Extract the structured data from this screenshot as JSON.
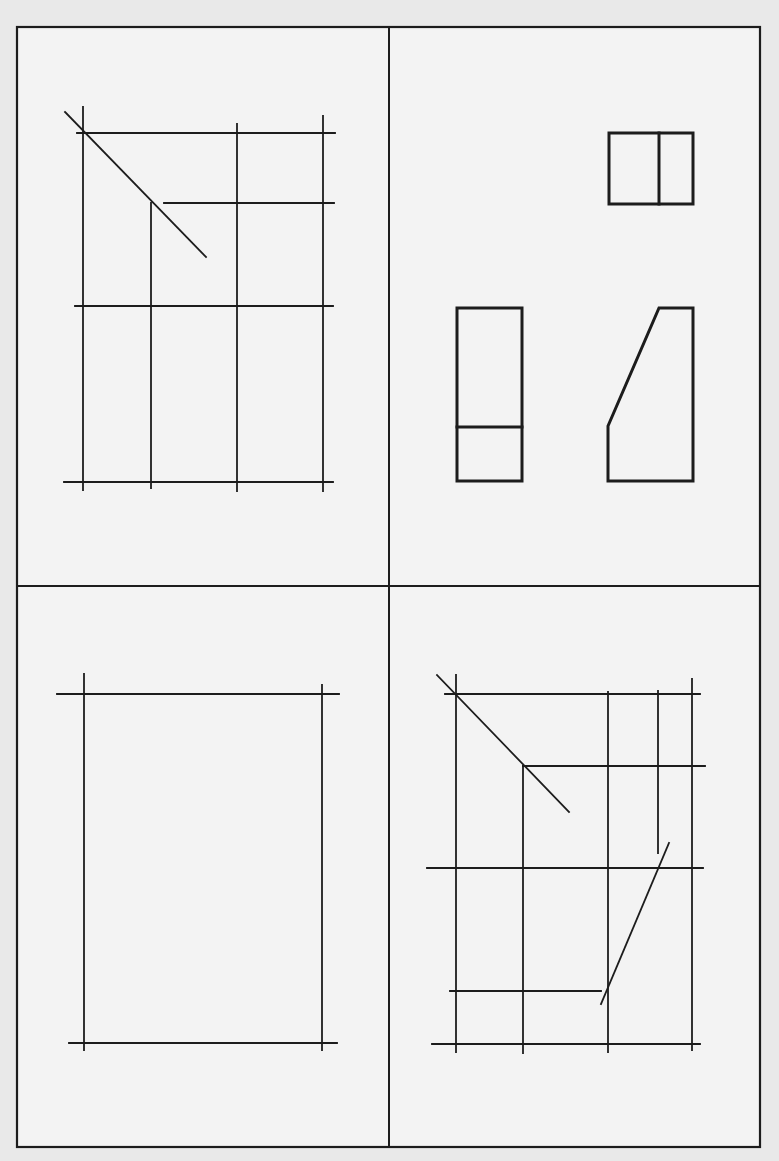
{
  "figure": {
    "colors": {
      "paper": "#e9e9e9",
      "panel": "#f3f3f3",
      "ink": "#1c1c1c"
    },
    "frame": {
      "x": 17,
      "y": 27,
      "w": 743,
      "h": 1120,
      "divider_x": 389,
      "divider_y": 586
    }
  },
  "panels": {
    "top_left": {
      "name": "construction-grid-top-left",
      "lines": [
        [
          65,
          112,
          206,
          257
        ],
        [
          83,
          107,
          83,
          490
        ],
        [
          77,
          133,
          335,
          133
        ],
        [
          237,
          124,
          237,
          491
        ],
        [
          323,
          116,
          323,
          491
        ],
        [
          164,
          203,
          334,
          203
        ],
        [
          151,
          203,
          151,
          488
        ],
        [
          75,
          306,
          333,
          306
        ],
        [
          64,
          482,
          333,
          482
        ]
      ]
    },
    "top_right": {
      "name": "three-view-block",
      "top_view": {
        "rect": [
          609,
          133,
          84,
          71
        ],
        "inner_x": 659
      },
      "front_view": {
        "rect": [
          457,
          308,
          65,
          173
        ],
        "inner_y": 427
      },
      "side_view": {
        "polygon": [
          [
            659,
            308
          ],
          [
            693,
            308
          ],
          [
            693,
            481
          ],
          [
            608,
            481
          ],
          [
            608,
            426
          ]
        ]
      }
    },
    "bottom_left": {
      "name": "blank-frame",
      "lines": [
        [
          84,
          674,
          84,
          1050
        ],
        [
          57,
          694,
          339,
          694
        ],
        [
          322,
          685,
          322,
          1050
        ],
        [
          69,
          1043,
          337,
          1043
        ]
      ]
    },
    "bottom_right": {
      "name": "construction-grid-with-miter",
      "lines": [
        [
          437,
          675,
          569,
          812
        ],
        [
          456,
          675,
          456,
          1052
        ],
        [
          445,
          694,
          700,
          694
        ],
        [
          608,
          692,
          608,
          1052
        ],
        [
          658,
          691,
          658,
          853
        ],
        [
          692,
          679,
          692,
          1050
        ],
        [
          523,
          766,
          705,
          766
        ],
        [
          523,
          766,
          523,
          1053
        ],
        [
          427,
          868,
          703,
          868
        ],
        [
          669,
          843,
          601,
          1004
        ],
        [
          450,
          991,
          601,
          991
        ],
        [
          432,
          1044,
          700,
          1044
        ]
      ]
    }
  }
}
